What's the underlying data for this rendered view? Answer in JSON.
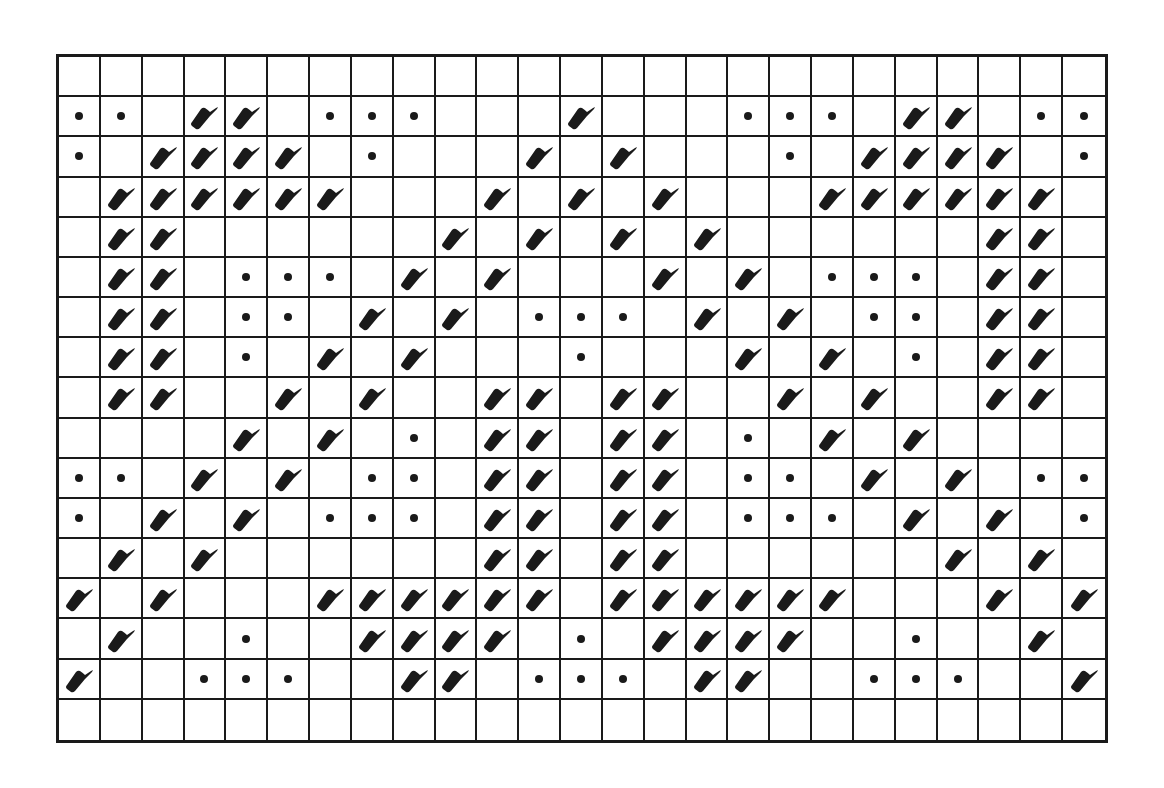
{
  "chart": {
    "rows": 17,
    "cols": 25,
    "legend": {
      "L": "leaf-symbol",
      "D": "dot-symbol",
      ".": "empty"
    },
    "ink_color": "#1a1a1a",
    "background": "#ffffff",
    "grid": [
      ".........................",
      "DD.LL.DDD...L...DDD.LL.DD",
      "D.LLLL.D...L.L...D.LLLL.D",
      ".LLLLLL...L.L.L...LLLLLL.",
      ".LL......L.L.L.L......LL.",
      ".LL.DDD.L.L...L.L.DDD.LL.",
      ".LL.DD.L.L.DDD.L.L.DD.LL.",
      ".LL.D.L.L...D...L.L.D.LL.",
      ".LL..L.L..LL.LL..L.L..LL.",
      "....L.L.D.LL.LL.D.L.L....",
      "DD.L.L.DD.LL.LL.DD.L.L.DD",
      "D.L.L.DDD.LL.LL.DDD.L.L.D",
      ".L.L......LL.LL......L.L.",
      "L.L...LLLLLL.LLLLLL...L.L",
      ".L..D..LLLL.D.LLLL..D..L.",
      "L..DDD..LL.DDD.LL..DDD..L",
      "........................."
    ]
  }
}
